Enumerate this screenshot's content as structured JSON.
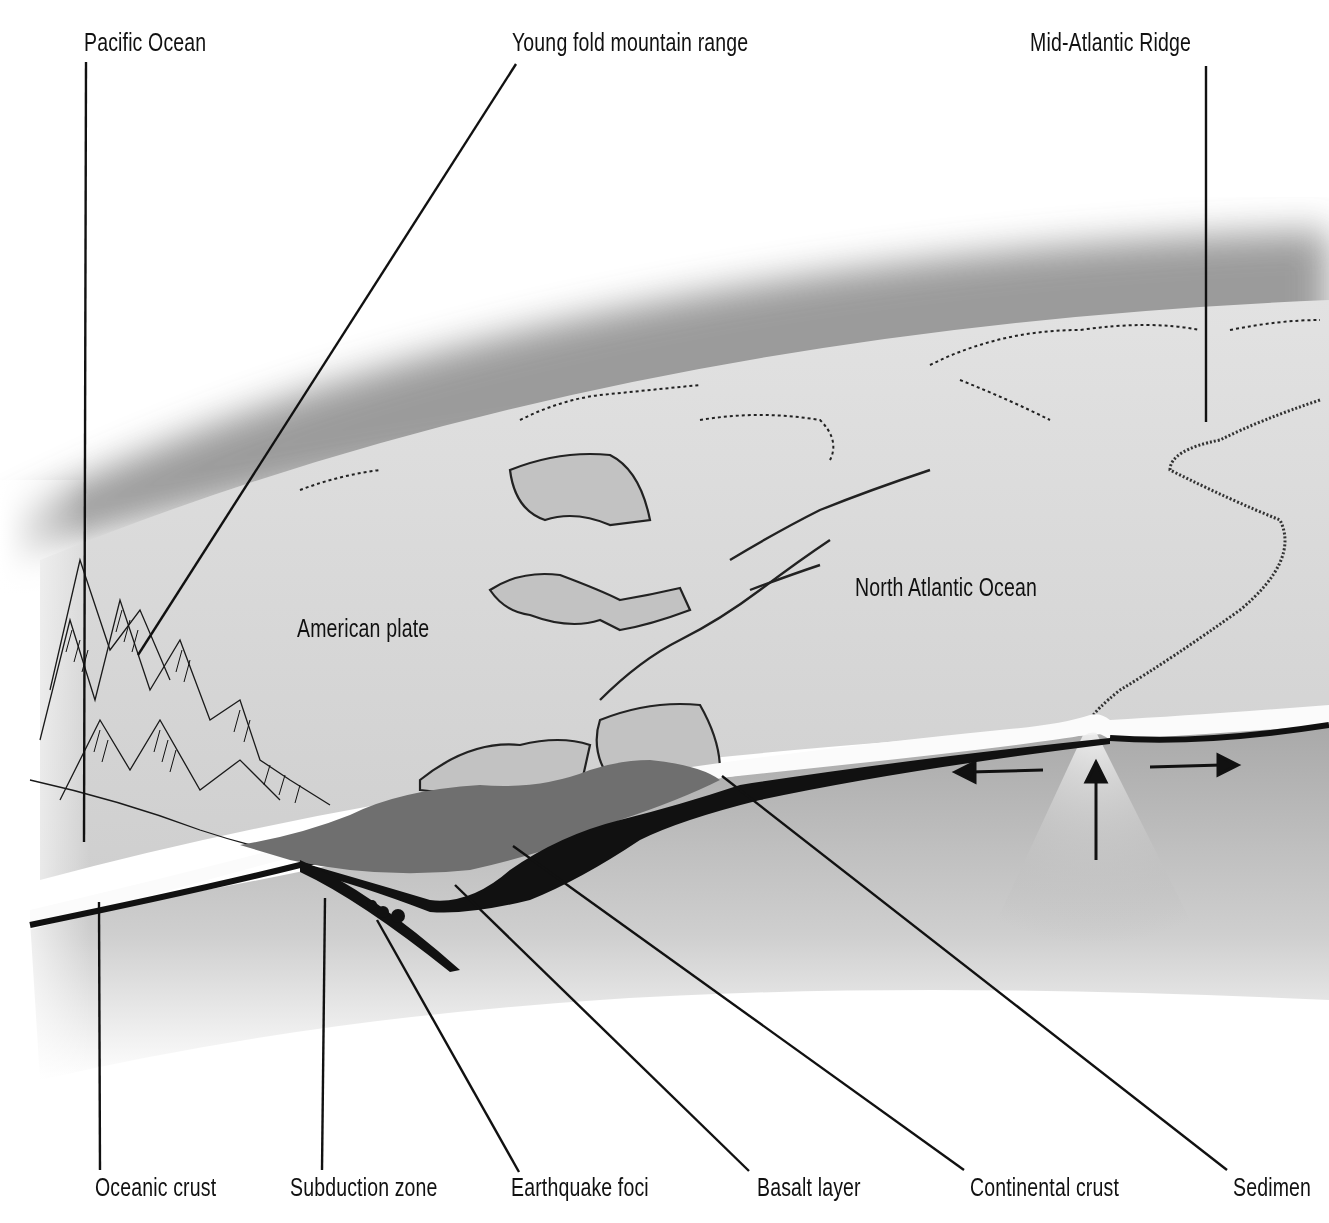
{
  "diagram": {
    "top_labels": [
      {
        "id": "pacific-ocean",
        "text": "Pacific Ocean"
      },
      {
        "id": "young-fold-mountain-range",
        "text": "Young fold mountain range"
      },
      {
        "id": "mid-atlantic-ridge",
        "text": "Mid-Atlantic Ridge"
      }
    ],
    "inline_labels": [
      {
        "id": "american-plate",
        "text": "American plate"
      },
      {
        "id": "north-atlantic-ocean",
        "text": "North Atlantic Ocean"
      }
    ],
    "bottom_labels": [
      {
        "id": "oceanic-crust",
        "text": "Oceanic crust"
      },
      {
        "id": "subduction-zone",
        "text": "Subduction zone"
      },
      {
        "id": "earthquake-foci",
        "text": "Earthquake foci"
      },
      {
        "id": "basalt-layer",
        "text": "Basalt layer"
      },
      {
        "id": "continental-crust",
        "text": "Continental crust"
      },
      {
        "id": "sediment",
        "text": "Sedimen"
      }
    ],
    "arrows": [
      {
        "id": "spreading-left",
        "direction": "left"
      },
      {
        "id": "upwelling",
        "direction": "up"
      },
      {
        "id": "spreading-right",
        "direction": "right"
      }
    ],
    "colors": {
      "background": "#ffffff",
      "surface": "#d6d6d6",
      "land": "#bdbdbd",
      "continental_crust": "#6e6e6e",
      "basalt": "#111111",
      "ink": "#111111"
    }
  }
}
